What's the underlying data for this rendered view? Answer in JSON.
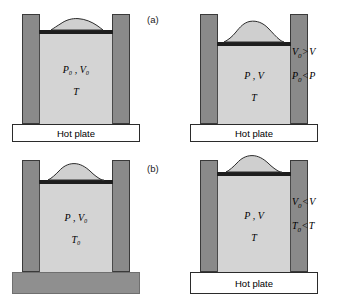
{
  "figure": {
    "title_visible": false,
    "background_color": "#ffffff",
    "colors": {
      "wall": "#8a8a8a",
      "gas": "#d4d4d4",
      "piston": "#1e1e1e",
      "hot_plate": "#ffffff",
      "cold_plate": "#8f8f8f",
      "outline": "#2b2b2b"
    }
  },
  "panels": [
    {
      "letter": "(a)",
      "process": "isothermal-compression",
      "states": [
        {
          "id": "a-initial",
          "gas_line1": "P₀ , V₀",
          "gas_line2": "T",
          "pressure_symbol": "P",
          "pressure_sub": "0",
          "volume_symbol": "V",
          "volume_sub": "0",
          "temp_symbol": "T",
          "temp_sub": "",
          "plate_label": "Hot plate",
          "plate_state": "lit",
          "sand_amount": "small",
          "piston_level": "high"
        },
        {
          "id": "a-final",
          "gas_line1": "P , V",
          "gas_line2": "T",
          "pressure_symbol": "P",
          "pressure_sub": "",
          "volume_symbol": "V",
          "volume_sub": "",
          "temp_symbol": "T",
          "temp_sub": "",
          "plate_label": "Hot plate",
          "plate_state": "lit",
          "sand_amount": "large",
          "piston_level": "low"
        }
      ],
      "relations": [
        {
          "left": "V",
          "left_sub": "0",
          "op": ">",
          "right": "V",
          "right_sub": "",
          "text": "V₀ > V"
        },
        {
          "left": "P",
          "left_sub": "0",
          "op": "<",
          "right": "P",
          "right_sub": "",
          "text": "P₀ < P"
        }
      ]
    },
    {
      "letter": "(b)",
      "process": "isobaric-expansion",
      "states": [
        {
          "id": "b-initial",
          "gas_line1": "P , V₀",
          "gas_line2": "T₀",
          "pressure_symbol": "P",
          "pressure_sub": "",
          "volume_symbol": "V",
          "volume_sub": "0",
          "temp_symbol": "T",
          "temp_sub": "0",
          "plate_label": "Hot plate",
          "plate_state": "unlit",
          "sand_amount": "medium",
          "piston_level": "mid"
        },
        {
          "id": "b-final",
          "gas_line1": "P , V",
          "gas_line2": "T",
          "pressure_symbol": "P",
          "pressure_sub": "",
          "volume_symbol": "V",
          "volume_sub": "",
          "temp_symbol": "T",
          "temp_sub": "",
          "plate_label": "Hot plate",
          "plate_state": "lit",
          "sand_amount": "medium",
          "piston_level": "high"
        }
      ],
      "relations": [
        {
          "left": "V",
          "left_sub": "0",
          "op": "<",
          "right": "V",
          "right_sub": "",
          "text": "V₀ < V"
        },
        {
          "left": "T",
          "left_sub": "0",
          "op": "<",
          "right": "T",
          "right_sub": "",
          "text": "T₀ < T"
        }
      ]
    }
  ]
}
